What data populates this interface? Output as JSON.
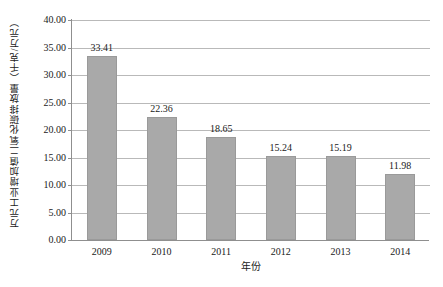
{
  "chart_data": {
    "type": "bar",
    "title": "",
    "xlabel": "年份",
    "ylabel": "万元工业增加值二氧化碳排放量（千克/万元）",
    "categories": [
      "2009",
      "2010",
      "2011",
      "2012",
      "2013",
      "2014"
    ],
    "values": [
      33.41,
      22.36,
      18.65,
      15.24,
      15.19,
      11.98
    ],
    "value_labels": [
      "33.41",
      "22.36",
      "18.65",
      "15.24",
      "15.19",
      "11.98"
    ],
    "ylim": [
      0,
      40
    ],
    "y_tick_values": [
      40,
      35,
      30,
      25,
      20,
      15,
      10,
      5,
      0
    ],
    "y_tick_labels": [
      "40.00",
      "35.00",
      "30.00",
      "25.00",
      "20.00",
      "15.00",
      "10.00",
      "5.00",
      "0.00"
    ],
    "grid": "horizontal",
    "legend": "none",
    "series_color": "#a9a9a9",
    "grid_color": "#b9b9b9",
    "axis_color": "#8f8f8f",
    "background_color": "#ffffff"
  }
}
